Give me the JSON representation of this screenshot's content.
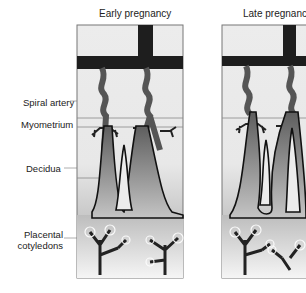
{
  "panels": [
    {
      "id": "early",
      "title": "Early pregnancy"
    },
    {
      "id": "late",
      "title": "Late pregnancy"
    }
  ],
  "labels": {
    "spiral_artery": "Spiral artery",
    "myometrium": "Myometrium",
    "decidua": "Decidua",
    "placental_line1": "Placental",
    "placental_line2": "cotyledons"
  },
  "colors": {
    "vessel": "#1e1e1e",
    "panel_bg": "#e9e9e9",
    "frame": "#777777"
  }
}
